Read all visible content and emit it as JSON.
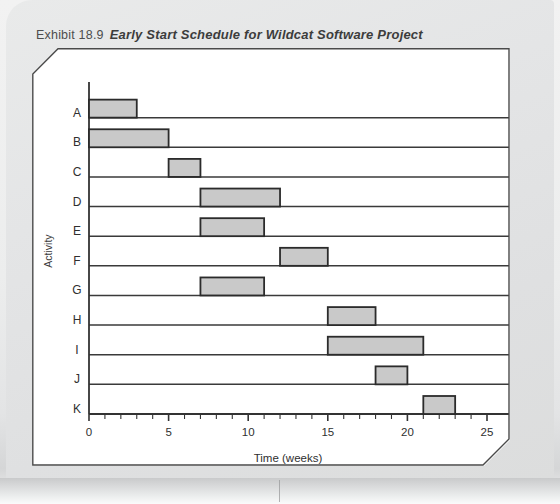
{
  "exhibit": {
    "label": "Exhibit 18.9",
    "title": "Early Start Schedule for Wildcat Software Project"
  },
  "colors": {
    "bar_fill": "#c9c9c9",
    "bar_stroke": "#2b2b2b",
    "axis": "#333333",
    "grid": "#3a3a3a",
    "panel_bg": "#ffffff",
    "page_bg": "#e4e5e6"
  },
  "chart_data": {
    "type": "bar",
    "orientation": "horizontal",
    "title": "Early Start Schedule for Wildcat Software Project",
    "xlabel": "Time (weeks)",
    "ylabel": "Activity",
    "xlim": [
      0,
      25
    ],
    "ylim_categories": [
      "A",
      "B",
      "C",
      "D",
      "E",
      "F",
      "G",
      "H",
      "I",
      "J",
      "K"
    ],
    "xticks": [
      0,
      5,
      10,
      15,
      20,
      25
    ],
    "xtick_labels": [
      "0",
      "5",
      "10",
      "15",
      "20",
      "25"
    ],
    "xminor_tick_step": 1,
    "grid": true,
    "legend": null,
    "categories": [
      "A",
      "B",
      "C",
      "D",
      "E",
      "F",
      "G",
      "H",
      "I",
      "J",
      "K"
    ],
    "bars": [
      {
        "activity": "A",
        "start": 0,
        "end": 3,
        "duration": 3
      },
      {
        "activity": "B",
        "start": 0,
        "end": 5,
        "duration": 5
      },
      {
        "activity": "C",
        "start": 5,
        "end": 7,
        "duration": 2
      },
      {
        "activity": "D",
        "start": 7,
        "end": 12,
        "duration": 5
      },
      {
        "activity": "E",
        "start": 7,
        "end": 11,
        "duration": 4
      },
      {
        "activity": "F",
        "start": 12,
        "end": 15,
        "duration": 3
      },
      {
        "activity": "G",
        "start": 7,
        "end": 11,
        "duration": 4
      },
      {
        "activity": "H",
        "start": 15,
        "end": 18,
        "duration": 3
      },
      {
        "activity": "I",
        "start": 15,
        "end": 21,
        "duration": 6
      },
      {
        "activity": "J",
        "start": 18,
        "end": 20,
        "duration": 2
      },
      {
        "activity": "K",
        "start": 21,
        "end": 23,
        "duration": 2
      }
    ]
  }
}
